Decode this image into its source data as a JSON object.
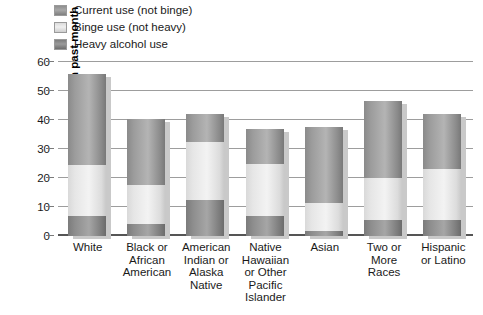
{
  "legend": {
    "items": [
      {
        "label": "Current use (not binge)",
        "swatch": "legend-swatch-current",
        "color": "#a8a8a8"
      },
      {
        "label": "Binge use (not heavy)",
        "swatch": "legend-swatch-binge",
        "color": "#efefef"
      },
      {
        "label": "Heavy alcohol use",
        "swatch": "legend-swatch-heavy",
        "color": "#9b9b9b"
      }
    ]
  },
  "axis": {
    "y_title": "Percent using in past month",
    "y_ticks": [
      "60",
      "50",
      "40",
      "30",
      "20",
      "10",
      "0"
    ]
  },
  "chart_data": {
    "type": "bar",
    "title": "",
    "subtitle": "",
    "xlabel": "",
    "ylabel": "Percent using in past month",
    "ylim": [
      0,
      60
    ],
    "ytick_values": [
      0,
      10,
      20,
      30,
      40,
      50,
      60
    ],
    "grid": true,
    "stacked": true,
    "legend_position": "top-left",
    "categories": [
      "White",
      "Black or African American",
      "American Indian or Alaska Native",
      "Native Hawaiian or Other Pacific Islander",
      "Asian",
      "Two or More Races",
      "Hispanic or Latino"
    ],
    "category_lines": [
      [
        "White"
      ],
      [
        "Black or",
        "African",
        "American"
      ],
      [
        "American",
        "Indian or",
        "Alaska",
        "Native"
      ],
      [
        "Native",
        "Hawaiian",
        "or Other",
        "Pacific",
        "Islander"
      ],
      [
        "Asian"
      ],
      [
        "Two or",
        "More",
        "Races"
      ],
      [
        "Hispanic",
        "or Latino"
      ]
    ],
    "series": [
      {
        "name": "Heavy alcohol use",
        "color": "#9b9b9b",
        "values": [
          7.0,
          4.0,
          12.3,
          6.8,
          1.9,
          5.4,
          5.5
        ]
      },
      {
        "name": "Binge use (not heavy)",
        "color": "#efefef",
        "values": [
          17.4,
          13.5,
          20.0,
          18.2,
          9.6,
          14.6,
          17.5
        ]
      },
      {
        "name": "Current use (not binge)",
        "color": "#a8a8a8",
        "values": [
          31.6,
          23.0,
          9.7,
          12.0,
          26.0,
          26.5,
          19.0
        ]
      }
    ],
    "totals": [
      56.0,
      40.5,
      42.0,
      37.0,
      37.5,
      46.5,
      42.0
    ],
    "segment_boundaries": {
      "heavy_top": [
        7.0,
        4.0,
        12.3,
        6.8,
        1.9,
        5.4,
        5.5
      ],
      "binge_top": [
        24.4,
        17.5,
        32.3,
        25.0,
        11.5,
        20.0,
        23.0
      ],
      "current_top": [
        56.0,
        40.5,
        42.0,
        37.0,
        37.5,
        46.5,
        42.0
      ]
    }
  }
}
